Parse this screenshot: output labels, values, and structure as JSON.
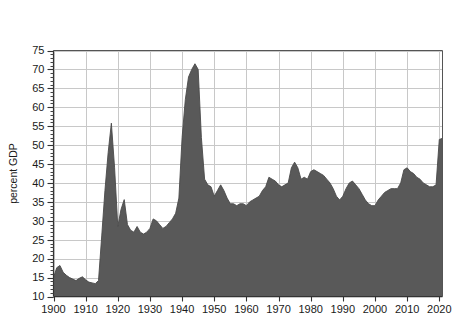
{
  "chart_data": {
    "type": "area",
    "title": "Total Spending",
    "subtitle": "United Kingdom from FY 1900 to FY 2021",
    "xlabel": "",
    "ylabel": "percent GDP",
    "xlim": [
      1900,
      2021
    ],
    "ylim": [
      10,
      75
    ],
    "grid": true,
    "legend": "none",
    "fill_color": "#595959",
    "line_color": "#4a4a4a",
    "background_color": "#ffffff",
    "grid_color": "#c8c8c8",
    "axis_color": "#555555",
    "ytick_values": [
      10,
      15,
      20,
      25,
      30,
      35,
      40,
      45,
      50,
      55,
      60,
      65,
      70,
      75
    ],
    "ytick_labels": [
      "10",
      "15",
      "20",
      "25",
      "30",
      "35",
      "40",
      "45",
      "50",
      "55",
      "60",
      "65",
      "70",
      "75"
    ],
    "xtick_values": [
      1900,
      1910,
      1920,
      1930,
      1940,
      1950,
      1960,
      1970,
      1980,
      1990,
      2000,
      2010,
      2020
    ],
    "xtick_labels": [
      "1900",
      "1910",
      "1920",
      "1930",
      "1940",
      "1950",
      "1960",
      "1970",
      "1980",
      "1990",
      "2000",
      "2010",
      "2020"
    ],
    "x": [
      1900,
      1901,
      1902,
      1903,
      1904,
      1905,
      1906,
      1907,
      1908,
      1909,
      1910,
      1911,
      1912,
      1913,
      1914,
      1915,
      1916,
      1917,
      1918,
      1919,
      1920,
      1921,
      1922,
      1923,
      1924,
      1925,
      1926,
      1927,
      1928,
      1929,
      1930,
      1931,
      1932,
      1933,
      1934,
      1935,
      1936,
      1937,
      1938,
      1939,
      1940,
      1941,
      1942,
      1943,
      1944,
      1945,
      1946,
      1947,
      1948,
      1949,
      1950,
      1951,
      1952,
      1953,
      1954,
      1955,
      1956,
      1957,
      1958,
      1959,
      1960,
      1961,
      1962,
      1963,
      1964,
      1965,
      1966,
      1967,
      1968,
      1969,
      1970,
      1971,
      1972,
      1973,
      1974,
      1975,
      1976,
      1977,
      1978,
      1979,
      1980,
      1981,
      1982,
      1983,
      1984,
      1985,
      1986,
      1987,
      1988,
      1989,
      1990,
      1991,
      1992,
      1993,
      1994,
      1995,
      1996,
      1997,
      1998,
      1999,
      2000,
      2001,
      2002,
      2003,
      2004,
      2005,
      2006,
      2007,
      2008,
      2009,
      2010,
      2011,
      2012,
      2013,
      2014,
      2015,
      2016,
      2017,
      2018,
      2019,
      2020,
      2021
    ],
    "values": [
      15.0,
      17.6,
      18.2,
      16.4,
      15.6,
      15.0,
      14.6,
      14.2,
      14.8,
      15.2,
      14.4,
      13.8,
      13.6,
      13.4,
      14.2,
      26.0,
      38.0,
      48.0,
      55.8,
      44.0,
      28.5,
      33.0,
      35.6,
      29.0,
      27.5,
      27.0,
      28.5,
      27.0,
      26.5,
      27.0,
      28.0,
      30.5,
      30.0,
      29.0,
      28.0,
      28.5,
      29.5,
      30.5,
      32.0,
      36.0,
      52.0,
      62.0,
      68.0,
      70.0,
      71.5,
      70.0,
      52.0,
      41.0,
      39.5,
      39.0,
      36.5,
      38.0,
      39.5,
      38.0,
      36.0,
      34.5,
      34.5,
      34.0,
      34.5,
      34.5,
      34.0,
      35.0,
      35.5,
      36.0,
      36.5,
      38.0,
      39.0,
      41.5,
      41.0,
      40.5,
      39.5,
      39.0,
      39.5,
      40.0,
      44.0,
      45.5,
      44.0,
      41.0,
      41.5,
      41.0,
      43.0,
      43.5,
      43.0,
      42.5,
      42.0,
      41.0,
      40.0,
      38.5,
      36.5,
      35.5,
      36.5,
      38.5,
      40.0,
      40.5,
      39.5,
      38.5,
      37.0,
      35.5,
      34.5,
      34.0,
      34.0,
      35.5,
      36.5,
      37.5,
      38.0,
      38.5,
      38.5,
      38.5,
      40.0,
      43.5,
      44.0,
      43.0,
      42.5,
      41.5,
      41.0,
      40.0,
      39.5,
      39.0,
      39.0,
      39.5,
      51.5,
      51.8
    ]
  }
}
